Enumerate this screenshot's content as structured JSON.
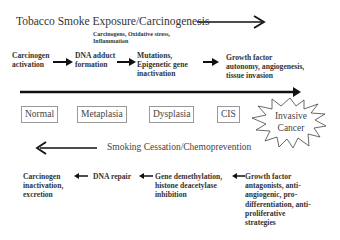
{
  "top": {
    "title": "Tobacco Smoke Exposure/Carcinogenesis",
    "subtitle_line1": "Carcinogens, Oxidative stress,",
    "subtitle_line2": "Inflammation",
    "steps": [
      {
        "line1": "Carcinogen",
        "line2": "activation",
        "line3": ""
      },
      {
        "line1": "DNA adduct",
        "line2": "formation",
        "line3": ""
      },
      {
        "line1": "Mutations,",
        "line2": "Epigenetic gene",
        "line3": "inactivation"
      },
      {
        "line1": "Growth factor",
        "line2": "autonomy, angiogenesis,",
        "line3": "tissue invasion"
      }
    ]
  },
  "progression": {
    "stages": [
      "Normal",
      "Metaplasia",
      "Dysplasia",
      "CIS"
    ],
    "final_stage_line1": "Invasive",
    "final_stage_line2": "Cancer"
  },
  "bottom": {
    "title": "Smoking Cessation/Chemoprevention",
    "steps": [
      {
        "line1": "Carcinogen",
        "line2": "inactivation,",
        "line3": "excretion"
      },
      {
        "line1": "DNA repair"
      },
      {
        "line1": "Gene demethylation,",
        "line2": "histone deacetylase",
        "line3": "inhibition"
      },
      {
        "line1": "Growth factor",
        "line2": "antagonists, anti-",
        "line3": "angiogenic, pro-",
        "line4": "differentiation, anti-",
        "line5": "proliferative",
        "line6": "strategies"
      }
    ]
  }
}
